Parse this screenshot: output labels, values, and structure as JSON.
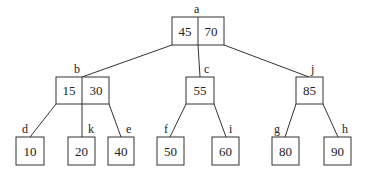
{
  "diagram": {
    "type": "b-tree",
    "colors": {
      "stroke": "#333333",
      "text": "#222222",
      "background": "#ffffff"
    },
    "nodes": {
      "a": {
        "label": "a",
        "keys": [
          "45",
          "70"
        ]
      },
      "b": {
        "label": "b",
        "keys": [
          "15",
          "30"
        ]
      },
      "c": {
        "label": "c",
        "keys": [
          "55"
        ]
      },
      "j": {
        "label": "j",
        "keys": [
          "85"
        ]
      },
      "d": {
        "label": "d",
        "keys": [
          "10"
        ]
      },
      "k": {
        "label": "k",
        "keys": [
          "20"
        ]
      },
      "e": {
        "label": "e",
        "keys": [
          "40"
        ]
      },
      "f": {
        "label": "f",
        "keys": [
          "50"
        ]
      },
      "i": {
        "label": "i",
        "keys": [
          "60"
        ]
      },
      "g": {
        "label": "g",
        "keys": [
          "80"
        ]
      },
      "h": {
        "label": "h",
        "keys": [
          "90"
        ]
      }
    },
    "edges": [
      [
        "a",
        "b"
      ],
      [
        "a",
        "c"
      ],
      [
        "a",
        "j"
      ],
      [
        "b",
        "d"
      ],
      [
        "b",
        "k"
      ],
      [
        "b",
        "e"
      ],
      [
        "c",
        "f"
      ],
      [
        "c",
        "i"
      ],
      [
        "j",
        "g"
      ],
      [
        "j",
        "h"
      ]
    ]
  }
}
